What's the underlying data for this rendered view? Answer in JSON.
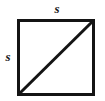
{
  "figure": {
    "name": "square-with-diagonal",
    "background_color": "#ffffff",
    "stroke_color": "#141414",
    "labels": {
      "top_side": "s",
      "left_side": "s"
    },
    "geometry": {
      "square": {
        "x": 17,
        "y": 19,
        "width": 77,
        "height": 76,
        "stroke_width": 3
      },
      "diagonal": {
        "x1": 18,
        "y1": 94,
        "x2": 93,
        "y2": 20,
        "stroke_width": 3
      }
    }
  }
}
